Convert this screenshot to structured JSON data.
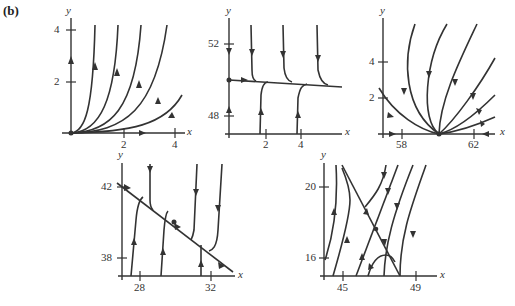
{
  "figure_label": "(b)",
  "panels": [
    {
      "id": "p1",
      "y_label": "y",
      "x_label": "x",
      "y_ticks": [
        "4",
        "2"
      ],
      "x_ticks": [
        "2",
        "4"
      ]
    },
    {
      "id": "p2",
      "y_label": "y",
      "x_label": "x",
      "y_ticks": [
        "52",
        "48"
      ],
      "x_ticks": [
        "2",
        "4"
      ]
    },
    {
      "id": "p3",
      "y_label": "y",
      "x_label": "x",
      "y_ticks": [
        "4",
        "2"
      ],
      "x_ticks": [
        "58",
        "62"
      ]
    },
    {
      "id": "p4",
      "y_label": "y",
      "x_label": "x",
      "y_ticks": [
        "42",
        "38"
      ],
      "x_ticks": [
        "28",
        "32"
      ]
    },
    {
      "id": "p5",
      "y_label": "y",
      "x_label": "x",
      "y_ticks": [
        "20",
        "16"
      ],
      "x_ticks": [
        "45",
        "49"
      ]
    }
  ],
  "colors": {
    "ink": "#333333",
    "background": "#ffffff"
  }
}
